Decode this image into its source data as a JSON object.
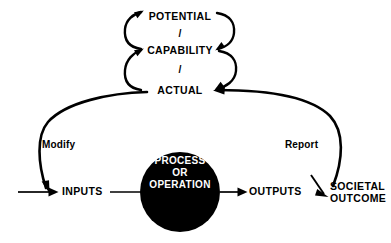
{
  "diagram": {
    "type": "flow-feedback-cycle",
    "background_color": "#ffffff",
    "stroke_color": "#000000",
    "node_fill_color": "#000000",
    "node_text_color": "#ffffff"
  },
  "cycle": {
    "name": "performance-hierarchy",
    "levels": [
      {
        "id": "potential",
        "label": "POTENTIAL"
      },
      {
        "id": "capability",
        "label": "CAPABILITY"
      },
      {
        "id": "actual",
        "label": "ACTUAL"
      }
    ],
    "separators": [
      {
        "id": "sep-1",
        "label": "/"
      },
      {
        "id": "sep-2",
        "label": "/"
      }
    ]
  },
  "flow": {
    "nodes": [
      {
        "id": "inputs",
        "label": "INPUTS"
      },
      {
        "id": "process",
        "label_line_1": "PROCESS",
        "label_line_2": "OR",
        "label_line_3": "OPERATION"
      },
      {
        "id": "outputs",
        "label": "OUTPUTS"
      },
      {
        "id": "societal-outcome",
        "label_line_1": "SOCIETAL",
        "label_line_2": "OUTCOME"
      }
    ]
  },
  "feedback": {
    "modify": {
      "id": "modify",
      "label": "Modify",
      "from": "ACTUAL",
      "to": "INPUTS"
    },
    "report": {
      "id": "report",
      "label": "Report",
      "from": "SOCIETAL OUTCOME",
      "to": "ACTUAL"
    }
  },
  "connectors": [
    {
      "id": "entry-to-inputs",
      "kind": "arrow"
    },
    {
      "id": "inputs-to-process",
      "kind": "line"
    },
    {
      "id": "process-to-outputs",
      "kind": "arrow"
    },
    {
      "id": "outputs-to-societal",
      "kind": "arrow"
    },
    {
      "id": "actual-to-capability",
      "kind": "curved-arrow"
    },
    {
      "id": "capability-to-potential",
      "kind": "curved-arrow"
    },
    {
      "id": "potential-to-capability",
      "kind": "curved-arrow"
    },
    {
      "id": "capability-to-actual",
      "kind": "curved-arrow"
    }
  ]
}
